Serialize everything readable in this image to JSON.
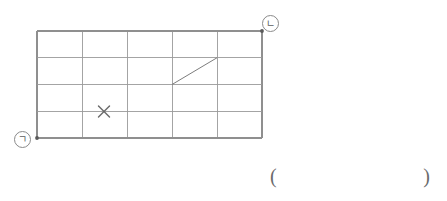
{
  "figure": {
    "grid": {
      "columns": 5,
      "rows": 4,
      "x0": 37,
      "y0": 31,
      "cell_width": 45,
      "cell_height": 26.75,
      "line_color": "#9a9a9a",
      "border_color": "#8f8f8f"
    },
    "vertices": [
      {
        "name": "bottom-left-corner",
        "label": "ㄱ",
        "dot_x": 37,
        "dot_y": 138,
        "label_x": 22,
        "label_y": 139
      },
      {
        "name": "top-right-corner",
        "label": "ㄴ",
        "dot_x": 262,
        "dot_y": 31,
        "label_x": 270,
        "label_y": 23
      }
    ],
    "diagonal": {
      "name": "diagonal-segment",
      "x1": 172,
      "y1": 84.5,
      "x2": 217,
      "y2": 57.75,
      "color": "#7d7d7d"
    },
    "x_mark": {
      "name": "x-mark",
      "x": 104,
      "y": 111.5,
      "size": 5.5,
      "color": "#6a6a6a"
    },
    "dot_color": "#5a5a5a"
  },
  "answer": {
    "open_paren": "(",
    "close_paren": ")",
    "value": ""
  }
}
